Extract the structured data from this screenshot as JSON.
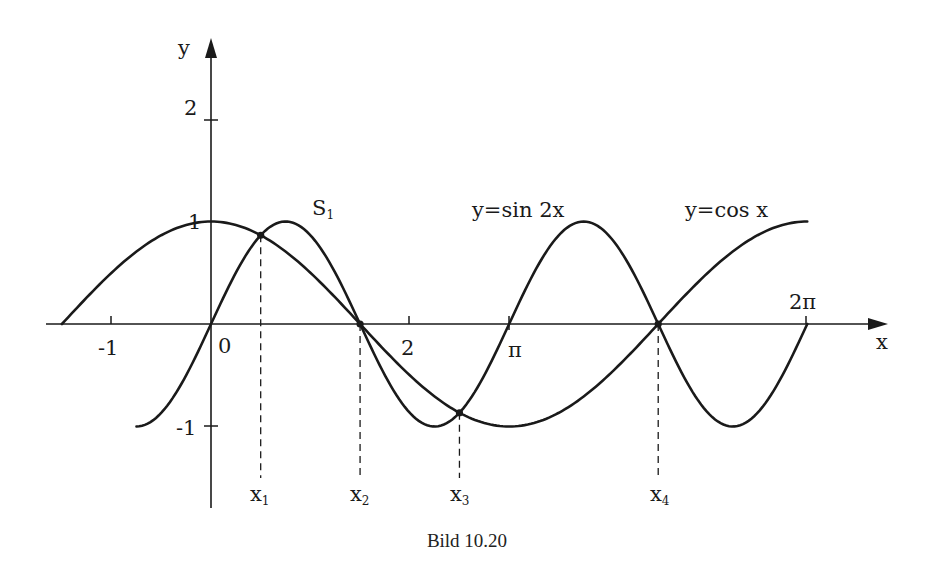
{
  "figure": {
    "caption": "Bild 10.20"
  },
  "chart_data": {
    "type": "line",
    "title": "",
    "xlabel": "x",
    "ylabel": "y",
    "xlim": [
      -1.6,
      7.2
    ],
    "ylim": [
      -1.8,
      2.8
    ],
    "x_ticks": [
      {
        "value": -1,
        "label": "-1"
      },
      {
        "value": 0,
        "label": "0"
      },
      {
        "value": 2,
        "label": "2"
      },
      {
        "value": 3.14159,
        "label": "π"
      },
      {
        "value": 6.28319,
        "label": "2π"
      }
    ],
    "y_ticks": [
      {
        "value": -1,
        "label": "-1"
      },
      {
        "value": 1,
        "label": "1"
      },
      {
        "value": 2,
        "label": "2"
      }
    ],
    "series": [
      {
        "name": "y=cos x",
        "function": "cos(x)",
        "x_range": [
          -1.5708,
          6.28319
        ]
      },
      {
        "name": "y=sin 2x",
        "function": "sin(2x)",
        "x_range": [
          -0.7854,
          6.28319
        ]
      }
    ],
    "intersections": [
      {
        "label": "x1",
        "x": 0.5236,
        "y": 0.866
      },
      {
        "label": "x2",
        "x": 1.5708,
        "y": 0.0
      },
      {
        "label": "x3",
        "x": 2.618,
        "y": -0.866
      },
      {
        "label": "x4",
        "x": 4.7124,
        "y": 0.0
      }
    ],
    "annotations": [
      {
        "text": "S1",
        "near": "intersection x1"
      },
      {
        "text": "y=sin 2x",
        "near": "second maximum of sin 2x"
      },
      {
        "text": "y=cos x",
        "near": "cos x rising toward 2π"
      }
    ],
    "grid": false,
    "legend": "none (inline labels)"
  },
  "labels": {
    "y_axis": "y",
    "x_axis": "x",
    "tick_neg1_x": "-1",
    "tick_0": "0",
    "tick_2_x": "2",
    "tick_pi": "π",
    "tick_2pi": "2π",
    "tick_1_y": "1",
    "tick_2_y": "2",
    "tick_neg1_y": "-1",
    "s1": "S",
    "s1_sub": "1",
    "sin_label": "y=sin 2x",
    "cos_label": "y=cos x",
    "x1": "x",
    "x1_sub": "1",
    "x2": "x",
    "x2_sub": "2",
    "x3": "x",
    "x3_sub": "3",
    "x4": "x",
    "x4_sub": "4"
  },
  "colors": {
    "ink": "#1a1a1a",
    "background": "#ffffff"
  }
}
